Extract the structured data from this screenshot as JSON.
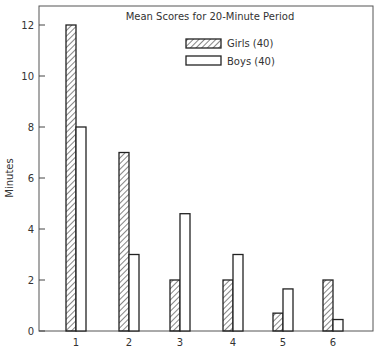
{
  "chart_data": {
    "type": "bar",
    "title": "Mean Scores for 20-Minute Period",
    "xlabel": "",
    "ylabel": "Minutes",
    "ylim": [
      0,
      12.8
    ],
    "yticks": [
      0,
      2,
      4,
      6,
      8,
      10,
      12
    ],
    "categories": [
      "1",
      "2",
      "3",
      "4",
      "5",
      "6"
    ],
    "series": [
      {
        "name": "Girls (40)",
        "pattern": "hatched",
        "values": [
          12,
          7,
          2,
          2,
          0.7,
          2
        ]
      },
      {
        "name": "Boys (40)",
        "pattern": "open",
        "values": [
          8,
          3,
          4.6,
          3,
          1.65,
          0.45
        ]
      }
    ],
    "legend_position": "upper right (inside)",
    "grid": false
  },
  "legend": {
    "girls_label": "Girls (40)",
    "boys_label": "Boys (40)"
  },
  "title": "Mean Scores for 20-Minute Period",
  "ylabel": "Minutes",
  "colors": {
    "stroke": "#222222",
    "background": "#ffffff",
    "frame": "#555555"
  }
}
